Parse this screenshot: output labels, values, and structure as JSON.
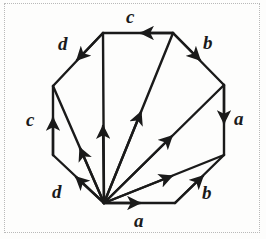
{
  "figure": {
    "background_color": "#fdfdfc",
    "border_color": "#b9b9b9",
    "border_style": "dotted",
    "stroke_color": "#1a1a1a",
    "label_color": "#1a1a1a"
  },
  "polygon": {
    "shape": "octagon",
    "vertices": [
      {
        "name": "top-left",
        "x": 103,
        "y": 33
      },
      {
        "name": "top-right",
        "x": 173,
        "y": 33
      },
      {
        "name": "right-top",
        "x": 224,
        "y": 85
      },
      {
        "name": "right-bottom",
        "x": 224,
        "y": 155
      },
      {
        "name": "bottom-right",
        "x": 175,
        "y": 203
      },
      {
        "name": "bottom-left",
        "x": 104,
        "y": 203
      },
      {
        "name": "left-bottom",
        "x": 53,
        "y": 155
      },
      {
        "name": "left-top",
        "x": 53,
        "y": 86
      }
    ],
    "hub_vertex": "bottom-left"
  },
  "edges": [
    {
      "id": "edge-c-top",
      "label": "c",
      "from": "top-right",
      "to": "top-left",
      "arrow_direction": "left",
      "label_x": 126,
      "label_y": 7
    },
    {
      "id": "edge-b-top-right",
      "label": "b",
      "from": "top-right",
      "to": "right-top",
      "arrow_direction": "down-right",
      "label_x": 203,
      "label_y": 33
    },
    {
      "id": "edge-a-right",
      "label": "a",
      "from": "right-top",
      "to": "right-bottom",
      "arrow_direction": "down",
      "label_x": 234,
      "label_y": 109
    },
    {
      "id": "edge-b-bottom-right",
      "label": "b",
      "from": "bottom-right",
      "to": "right-bottom",
      "arrow_direction": "up-right",
      "label_x": 202,
      "label_y": 183
    },
    {
      "id": "edge-a-bottom",
      "label": "a",
      "from": "bottom-left",
      "to": "bottom-right",
      "arrow_direction": "right",
      "label_x": 134,
      "label_y": 211
    },
    {
      "id": "edge-d-bottom-left",
      "label": "d",
      "from": "bottom-left",
      "to": "left-bottom",
      "arrow_direction": "up-left",
      "label_x": 52,
      "label_y": 182
    },
    {
      "id": "edge-c-left",
      "label": "c",
      "from": "left-bottom",
      "to": "left-top",
      "arrow_direction": "up",
      "label_x": 26,
      "label_y": 110
    },
    {
      "id": "edge-d-top-left",
      "label": "d",
      "from": "top-left",
      "to": "left-top",
      "arrow_direction": "down-left",
      "label_x": 58,
      "label_y": 34
    }
  ],
  "diagonals": [
    {
      "id": "diagonal-to-left-top",
      "from": "bottom-left",
      "to": "left-top",
      "arrow_direction": "up-left"
    },
    {
      "id": "diagonal-to-top-left",
      "from": "bottom-left",
      "to": "top-left",
      "arrow_direction": "up"
    },
    {
      "id": "diagonal-to-top-right",
      "from": "bottom-left",
      "to": "top-right",
      "arrow_direction": "up-right"
    },
    {
      "id": "diagonal-to-right-top",
      "from": "bottom-left",
      "to": "right-top",
      "arrow_direction": "up-right"
    },
    {
      "id": "diagonal-to-right-bottom",
      "from": "bottom-left",
      "to": "right-bottom",
      "arrow_direction": "up-right"
    }
  ]
}
